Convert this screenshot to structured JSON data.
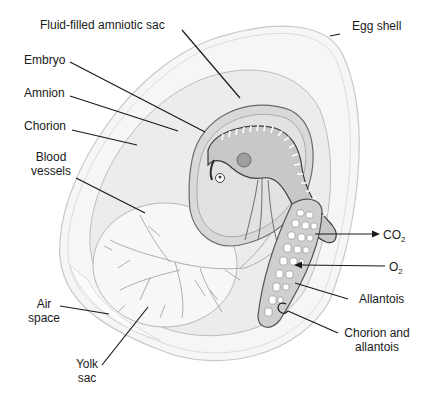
{
  "diagram": {
    "labels": {
      "fluid_filled_amniotic_sac": "Fluid-filled amniotic sac",
      "egg_shell": "Egg shell",
      "embryo": "Embryo",
      "amnion": "Amnion",
      "chorion": "Chorion",
      "blood_vessels_line1": "Blood",
      "blood_vessels_line2": "vessels",
      "co2_main": "CO",
      "co2_sub": "2",
      "o2_main": "O",
      "o2_sub": "2",
      "allantois": "Allantois",
      "chorion_allantois_line1": "Chorion and",
      "chorion_allantois_line2": "allantois",
      "air_space_line1": "Air",
      "air_space_line2": "space",
      "yolk_sac_line1": "Yolk",
      "yolk_sac_line2": "sac"
    },
    "arrows": {
      "co2": "outward (from allantois to outside)",
      "o2": "inward (from outside to allantois)"
    },
    "colors": {
      "shell": "#f4f4f4",
      "membrane": "#e6e6e6",
      "amniotic_fluid": "#dcdcdc",
      "yolk": "#f6f6f6",
      "line": "#1a1a1a"
    }
  }
}
